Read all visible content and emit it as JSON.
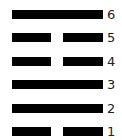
{
  "diagram": {
    "type": "hexagram",
    "line_color": "#000000",
    "lines": [
      {
        "position": 6,
        "label": "6",
        "kind": "solid"
      },
      {
        "position": 5,
        "label": "5",
        "kind": "broken"
      },
      {
        "position": 4,
        "label": "4",
        "kind": "broken"
      },
      {
        "position": 3,
        "label": "3",
        "kind": "solid"
      },
      {
        "position": 2,
        "label": "2",
        "kind": "solid"
      },
      {
        "position": 1,
        "label": "1",
        "kind": "broken"
      }
    ]
  }
}
